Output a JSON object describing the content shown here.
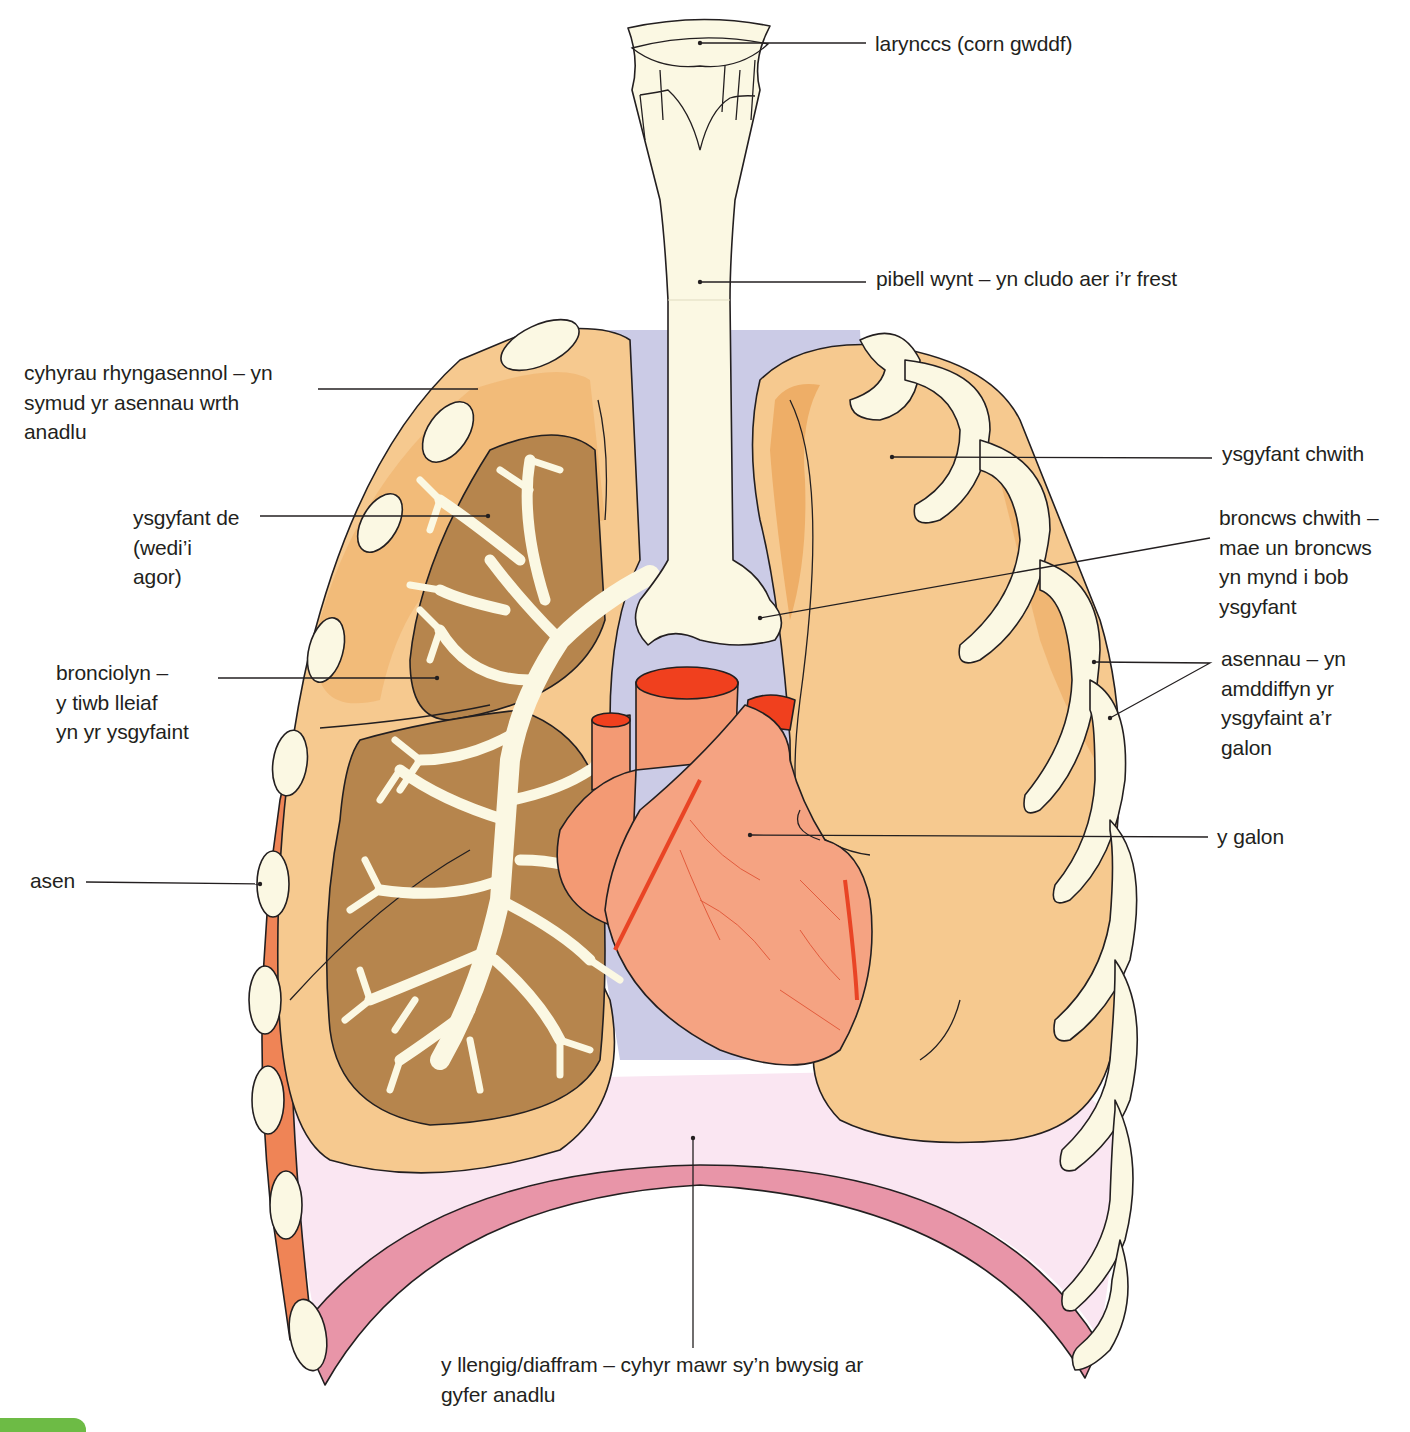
{
  "diagram": {
    "colors": {
      "cartilage": "#fbf8e3",
      "lung_light": "#f6c98f",
      "lung_dark_cut": "#b6854d",
      "lung_shadow": "#eeae67",
      "muscle_intercostal": "#ef8456",
      "heart": "#f39a74",
      "heart_vessel_top": "#f0401e",
      "mediastinum": "#cbcbe6",
      "diaphragm_band": "#e895a8",
      "diaphragm_fill": "#fae6f2",
      "outline": "#231f20",
      "corner_badge": "#6dbb45"
    }
  },
  "labels": {
    "larynx": "larynccs (corn gwddf)",
    "trachea": "pibell wynt – yn cludo aer i’r frest",
    "intercostal": "cyhyrau rhyngasennol – yn\nsymud yr asennau wrth\nanadlu",
    "left_lung": "ysgyfant chwith",
    "right_lung": "ysgyfant de\n(wedi’i\nagor)",
    "left_bronchus": "broncws chwith –\nmae un broncws\nyn mynd i bob\nysgyfant",
    "bronchiole": "bronciolyn –\ny tiwb lleiaf\nyn yr ysgyfaint",
    "ribs": "asennau – yn\namddiffyn yr\nysgyfaint a’r\ngalon",
    "heart": "y galon",
    "rib": "asen",
    "diaphragm": "y llengig/diaffram – cyhyr mawr sy’n bwysig ar\ngyfer anadlu"
  }
}
